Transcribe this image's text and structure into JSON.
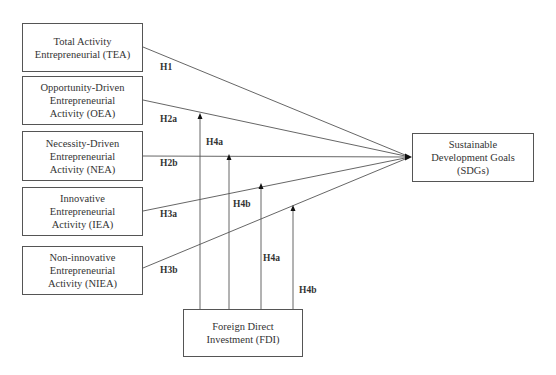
{
  "diagram": {
    "independent_variables": [
      {
        "id": "TEA",
        "label": "Total Activity\nEntrepreneurial (TEA)",
        "box": [
          22,
          23,
          121,
          49
        ],
        "anchor": [
          143,
          47
        ]
      },
      {
        "id": "OEA",
        "label": "Opportunity-Driven\nEntrepreneurial\nActivity (OEA)",
        "box": [
          22,
          76,
          121,
          49
        ],
        "anchor": [
          143,
          100
        ]
      },
      {
        "id": "NEA",
        "label": "Necessity-Driven\nEntrepreneurial\nActivity (NEA)",
        "box": [
          22,
          131,
          121,
          50
        ],
        "anchor": [
          143,
          156
        ]
      },
      {
        "id": "IEA",
        "label": "Innovative\nEntrepreneurial\nActivity (IEA)",
        "box": [
          22,
          187,
          121,
          49
        ],
        "anchor": [
          143,
          211
        ]
      },
      {
        "id": "NIEA",
        "label": "Non-innovative\nEntrepreneurial\nActivity (NIEA)",
        "box": [
          22,
          246,
          121,
          49
        ],
        "anchor": [
          143,
          268
        ]
      }
    ],
    "dependent_variable": {
      "id": "SDGs",
      "label": "Sustainable\nDevelopment Goals\n(SDGs)",
      "box": [
        412,
        133,
        122,
        49
      ],
      "anchor": [
        410,
        157
      ]
    },
    "moderator": {
      "id": "FDI",
      "label": "Foreign  Direct\nInvestment (FDI)",
      "box": [
        183,
        309,
        120,
        48
      ]
    },
    "hypotheses": [
      {
        "label": "H1",
        "x": 160,
        "y": 62
      },
      {
        "label": "H2a",
        "x": 160,
        "y": 114
      },
      {
        "label": "H2b",
        "x": 160,
        "y": 158
      },
      {
        "label": "H3a",
        "x": 160,
        "y": 209
      },
      {
        "label": "H3b",
        "x": 160,
        "y": 265
      },
      {
        "label": "H4a",
        "x": 206,
        "y": 137
      },
      {
        "label": "H4b",
        "x": 233,
        "y": 199
      },
      {
        "label": "H4a",
        "x": 263,
        "y": 253
      },
      {
        "label": "H4b",
        "x": 299,
        "y": 285
      }
    ],
    "moderation_arrows": [
      {
        "x": 200,
        "y_tip": 115
      },
      {
        "x": 229,
        "y_tip": 156
      },
      {
        "x": 261,
        "y_tip": 185
      },
      {
        "x": 293,
        "y_tip": 207
      }
    ],
    "caption": "Figure 1: Research framework"
  },
  "colors": {
    "line": "#555555",
    "text": "#333333"
  }
}
